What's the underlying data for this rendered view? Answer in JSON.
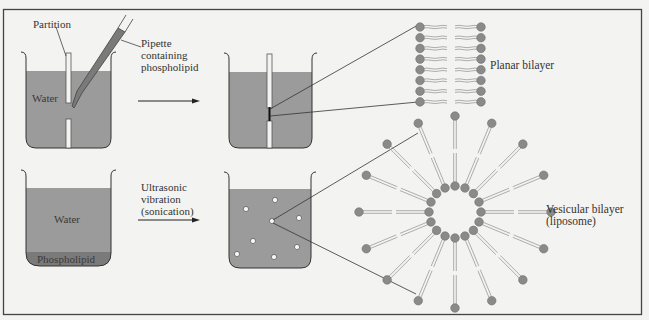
{
  "figure": {
    "colors": {
      "background": "#f3f3f1",
      "frame": "#444444",
      "water": "#9b9b9b",
      "phospholipid_layer": "#7a7a7a",
      "lipid_head": "#8a8a8a",
      "lipid_tail": "#9a9a9a",
      "line": "#333333"
    },
    "top_row": {
      "partition_label": "Partition",
      "pipette_label": "Pipette\ncontaining\nphospholipid",
      "water_label": "Water",
      "result_label": "Planar bilayer"
    },
    "bottom_row": {
      "water_label": "Water",
      "phospholipid_label": "Phospholipid",
      "arrow_label": "Ultrasonic\nvibration\n(sonication)",
      "result_label": "Vesicular bilayer\n(liposome)"
    },
    "planar_bilayer": {
      "lipids_per_leaflet": 8
    },
    "liposome": {
      "lipid_count": 16
    },
    "vesicles_in_beaker": 8
  }
}
